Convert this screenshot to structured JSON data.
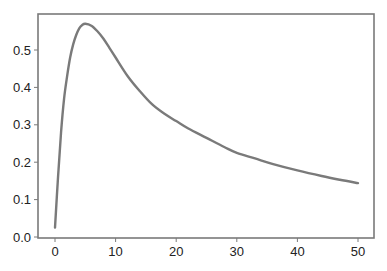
{
  "chart_data": {
    "type": "line",
    "title": "",
    "xlabel": "",
    "ylabel": "",
    "xlim": [
      -2.5,
      52.5
    ],
    "ylim": [
      -0.0,
      0.6
    ],
    "grid": false,
    "legend": null,
    "x_ticks": [
      "0",
      "10",
      "20",
      "30",
      "40",
      "50"
    ],
    "y_ticks": [
      "0.0",
      "0.1",
      "0.2",
      "0.3",
      "0.4",
      "0.5"
    ],
    "series": [
      {
        "name": "curve",
        "color": "#7a7a7a",
        "x": [
          0,
          0.5,
          1,
          1.5,
          2,
          2.5,
          3,
          3.5,
          4,
          4.5,
          5,
          6,
          7,
          8,
          9,
          10,
          12,
          14,
          16,
          18,
          20,
          22,
          25,
          28,
          30,
          33,
          36,
          40,
          44,
          47,
          50
        ],
        "y": [
          0.025,
          0.16,
          0.28,
          0.37,
          0.43,
          0.48,
          0.515,
          0.54,
          0.558,
          0.567,
          0.57,
          0.565,
          0.55,
          0.53,
          0.505,
          0.48,
          0.43,
          0.39,
          0.355,
          0.33,
          0.31,
          0.29,
          0.265,
          0.24,
          0.225,
          0.21,
          0.195,
          0.178,
          0.163,
          0.153,
          0.144
        ]
      }
    ]
  }
}
